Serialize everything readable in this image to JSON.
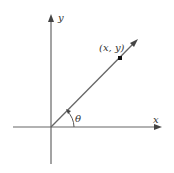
{
  "diagram": {
    "type": "angle-in-standard-position",
    "axes": {
      "x_label": "x",
      "y_label": "y"
    },
    "ray": {
      "point_label": "(x, y)",
      "angle_label": "θ"
    },
    "colors": {
      "axis": "#555555",
      "ray": "#555555",
      "point": "#111111",
      "text": "#333333"
    }
  }
}
